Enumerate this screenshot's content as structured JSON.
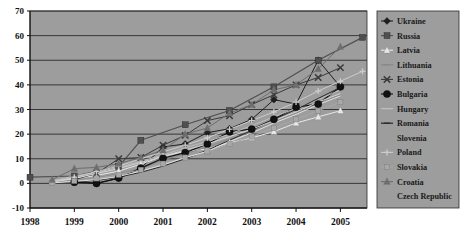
{
  "chart_data": {
    "type": "line",
    "title": "",
    "xlabel": "",
    "ylabel": "",
    "xlim": [
      1998,
      2005.6
    ],
    "ylim": [
      -10,
      70
    ],
    "yticks": [
      -10,
      0,
      10,
      20,
      30,
      40,
      50,
      60,
      70
    ],
    "xticks": [
      1998,
      1999,
      2000,
      2001,
      2002,
      2003,
      2004,
      2005
    ],
    "grid": true,
    "legend_position": "right",
    "plot_bg": "#9d9d9d",
    "legend_bg": "#9d9d9d",
    "x": [
      1998,
      1998.5,
      1999,
      1999.5,
      2000,
      2000.5,
      2001,
      2001.5,
      2002,
      2002.5,
      2003,
      2003.5,
      2004,
      2004.5,
      2005,
      2005.5
    ],
    "series": [
      {
        "name": "Ukraine",
        "marker": "diamond-filled",
        "color": "#1f1f1f",
        "values": [
          null,
          null,
          1.0,
          0.0,
          2.0,
          6.2,
          14.8,
          16.0,
          20.6,
          22.2,
          26.0,
          34.0,
          32.2,
          50.0,
          39.2,
          null
        ]
      },
      {
        "name": "Russia",
        "marker": "square-filled",
        "color": "#4f4f4f",
        "values": [
          2.5,
          null,
          3.0,
          null,
          6.8,
          17.5,
          null,
          23.8,
          null,
          29.6,
          null,
          39.2,
          null,
          50.0,
          null,
          59.3
        ]
      },
      {
        "name": "Latvia",
        "marker": "triangle-light",
        "color": "#e8e8e8",
        "values": [
          null,
          0.8,
          2.0,
          3.2,
          5.0,
          7.8,
          11.0,
          13.0,
          14.0,
          16.5,
          18.5,
          21.0,
          24.5,
          27.0,
          29.5,
          null
        ]
      },
      {
        "name": "Lithuania",
        "marker": "line",
        "color": "#8a8a8a",
        "values": [
          null,
          0.4,
          1.2,
          2.2,
          4.0,
          6.0,
          9.5,
          12.0,
          14.8,
          18.0,
          21.0,
          25.0,
          28.5,
          32.5,
          36.0,
          null
        ]
      },
      {
        "name": "Estonia",
        "marker": "x-cross",
        "color": "#3a3a3a",
        "values": [
          null,
          null,
          1.5,
          4.0,
          10.0,
          10.5,
          15.5,
          19.5,
          25.5,
          27.5,
          32.0,
          36.0,
          40.0,
          43.0,
          47.0,
          null
        ]
      },
      {
        "name": "Bulgaria",
        "marker": "circle-filled-large",
        "color": "#111111",
        "values": [
          null,
          null,
          0.5,
          0.0,
          2.2,
          6.2,
          10.2,
          12.5,
          16.0,
          21.0,
          22.0,
          26.0,
          31.0,
          32.2,
          39.2,
          null
        ]
      },
      {
        "name": "Hungary",
        "marker": "line",
        "color": "#bdbdbd",
        "values": [
          null,
          1.0,
          3.0,
          4.5,
          6.5,
          9.0,
          11.5,
          14.5,
          17.0,
          20.0,
          23.5,
          27.0,
          30.5,
          34.0,
          38.0,
          null
        ]
      },
      {
        "name": "Romania",
        "marker": "line",
        "color": "#2b2b2b",
        "values": [
          null,
          0.2,
          0.6,
          1.2,
          2.5,
          4.5,
          7.0,
          10.0,
          13.5,
          17.5,
          21.5,
          26.0,
          30.0,
          34.5,
          39.0,
          null
        ]
      },
      {
        "name": "Slovenia",
        "marker": "none",
        "color": "#d4d4d4",
        "values": [
          null,
          0.5,
          2.0,
          4.0,
          6.0,
          8.5,
          11.0,
          13.5,
          16.0,
          19.0,
          22.0,
          25.5,
          29.0,
          33.0,
          36.5,
          null
        ]
      },
      {
        "name": "Poland",
        "marker": "plus-light",
        "color": "#cccccc",
        "values": [
          null,
          0.6,
          2.5,
          4.8,
          7.0,
          10.0,
          12.8,
          15.5,
          18.5,
          22.0,
          25.5,
          29.0,
          33.0,
          37.5,
          41.5,
          45.5
        ]
      },
      {
        "name": "Slovakia",
        "marker": "square-light",
        "color": "#a8a8a8",
        "values": [
          null,
          0.3,
          1.0,
          2.0,
          3.5,
          5.5,
          8.0,
          10.5,
          13.0,
          16.0,
          19.0,
          22.5,
          26.0,
          29.5,
          33.0,
          null
        ]
      },
      {
        "name": "Croatia",
        "marker": "triangle-dark",
        "color": "#6e6e6e",
        "values": [
          null,
          1.5,
          6.0,
          6.5,
          8.0,
          10.5,
          13.5,
          20.0,
          22.5,
          28.5,
          32.0,
          38.0,
          40.0,
          46.5,
          55.5,
          null
        ]
      },
      {
        "name": "Czech Republic",
        "marker": "none",
        "color": "#e0e0e0",
        "values": [
          null,
          0.2,
          0.8,
          1.5,
          2.8,
          5.0,
          7.5,
          10.5,
          13.0,
          17.0,
          20.5,
          24.5,
          28.0,
          32.0,
          35.5,
          null
        ]
      }
    ]
  },
  "axis": {
    "y_tick_labels": [
      "70",
      "60",
      "50",
      "40",
      "30",
      "20",
      "10",
      "0",
      "-10"
    ],
    "x_tick_labels": [
      "1998",
      "1999",
      "2000",
      "2001",
      "2002",
      "2003",
      "2004",
      "2005"
    ]
  },
  "legend": {
    "items": [
      {
        "label": "Ukraine"
      },
      {
        "label": "Russia"
      },
      {
        "label": "Latvia"
      },
      {
        "label": "Lithuania"
      },
      {
        "label": "Estonia"
      },
      {
        "label": "Bulgaria"
      },
      {
        "label": "Hungary"
      },
      {
        "label": "Romania"
      },
      {
        "label": "Slovenia"
      },
      {
        "label": "Poland"
      },
      {
        "label": "Slovakia"
      },
      {
        "label": "Croatia"
      },
      {
        "label": "Czech Republic"
      }
    ]
  }
}
